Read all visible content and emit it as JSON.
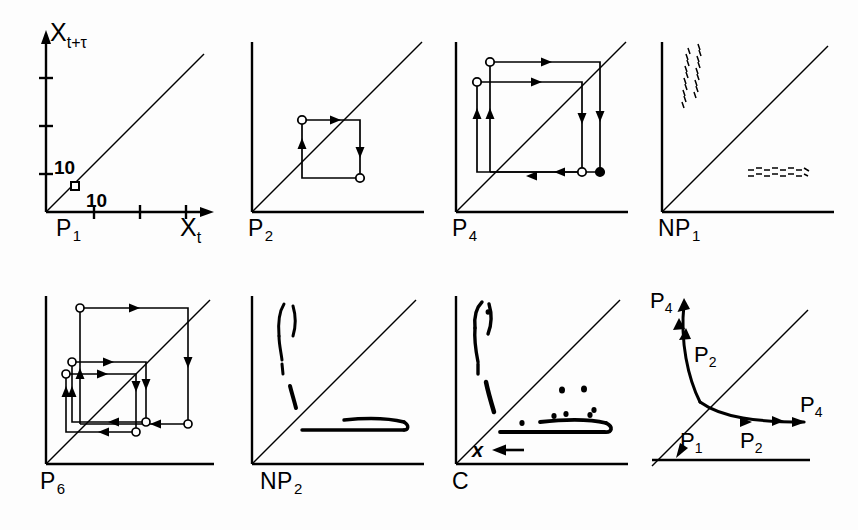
{
  "figure": {
    "background": "#fdfdfd",
    "ink": "#000000",
    "rows": 2,
    "cols": 4,
    "axis_labels": {
      "y": "X",
      "y_sub": "t+τ",
      "x": "X",
      "x_sub": "t",
      "y_tick_label": "10",
      "x_tick_label": "10"
    }
  },
  "panels": [
    {
      "id": "p1",
      "label": "P",
      "label_sub": "1",
      "caption": "P1",
      "type": "return-map",
      "description": "Fixed point: single open square marker on the identity diagonal",
      "markers": [
        {
          "kind": "open-square",
          "x": 0.16,
          "y": 0.16
        }
      ],
      "has_axes_labels": true,
      "diagonal": true
    },
    {
      "id": "p2",
      "label": "P",
      "label_sub": "2",
      "caption": "P2",
      "type": "return-map",
      "description": "Period-2 orbit: one square cycle with two open circles",
      "markers": [
        {
          "kind": "open-circle",
          "x": 0.33,
          "y": 0.62
        },
        {
          "kind": "open-circle",
          "x": 0.62,
          "y": 0.33
        }
      ],
      "diagonal": true
    },
    {
      "id": "p4",
      "label": "P",
      "label_sub": "4",
      "caption": "P4",
      "type": "return-map",
      "description": "Period-4 orbit: two nested rectangular cycles, three open circles and one filled circle",
      "markers": [
        {
          "kind": "open-circle",
          "x": 0.22,
          "y": 0.86
        },
        {
          "kind": "open-circle",
          "x": 0.16,
          "y": 0.74
        },
        {
          "kind": "open-circle",
          "x": 0.72,
          "y": 0.22
        },
        {
          "kind": "filled-circle",
          "x": 0.82,
          "y": 0.22
        }
      ],
      "diagonal": true
    },
    {
      "id": "np1",
      "label": "NP",
      "label_sub": "1",
      "caption": "NP1",
      "type": "noisy-return-map",
      "description": "Noisy period-1: one narrow vertical point cluster upper-left, one thin horizontal band lower-right",
      "clusters": [
        {
          "orientation": "vertical",
          "cx": 0.22,
          "cy": 0.78,
          "w": 0.06,
          "h": 0.3
        },
        {
          "orientation": "horizontal",
          "cx": 0.72,
          "cy": 0.28,
          "w": 0.34,
          "h": 0.05
        }
      ],
      "diagonal": true
    },
    {
      "id": "p6",
      "label": "P",
      "label_sub": "6",
      "caption": "P6",
      "type": "return-map",
      "description": "Period-6 orbit: three nested rectangular cycles with six circle markers",
      "markers": [
        {
          "kind": "open-circle",
          "x": 0.21,
          "y": 0.87
        },
        {
          "kind": "open-circle",
          "x": 0.17,
          "y": 0.58
        },
        {
          "kind": "open-circle",
          "x": 0.15,
          "y": 0.52
        },
        {
          "kind": "open-circle",
          "x": 0.56,
          "y": 0.21
        },
        {
          "kind": "open-circle",
          "x": 0.46,
          "y": 0.15
        },
        {
          "kind": "open-circle",
          "x": 0.86,
          "y": 0.21
        }
      ],
      "diagonal": true
    },
    {
      "id": "np2",
      "label": "NP",
      "label_sub": "2",
      "caption": "NP2",
      "type": "noisy-return-map",
      "description": "Noisy period-2: hooked vertical cluster upper-left plus a short steep segment, and a long horizontal band lower-right",
      "clusters": [
        {
          "orientation": "vertical-hook",
          "cx": 0.22,
          "cy": 0.8,
          "w": 0.07,
          "h": 0.34
        },
        {
          "orientation": "steep-segment",
          "cx": 0.26,
          "cy": 0.45,
          "w": 0.04,
          "h": 0.14
        },
        {
          "orientation": "horizontal",
          "cx": 0.66,
          "cy": 0.27,
          "w": 0.52,
          "h": 0.05
        }
      ],
      "diagonal": true
    },
    {
      "id": "c",
      "label": "C",
      "label_sub": "",
      "caption": "C",
      "type": "chaotic-return-map",
      "description": "Chaotic attractor: thick vertical blob upper-left, steep segment, broad horizontal band lower-right with scattered outlier points",
      "clusters": [
        {
          "orientation": "vertical-hook",
          "cx": 0.2,
          "cy": 0.8,
          "w": 0.08,
          "h": 0.36
        },
        {
          "orientation": "steep-segment",
          "cx": 0.24,
          "cy": 0.44,
          "w": 0.04,
          "h": 0.16
        },
        {
          "orientation": "horizontal",
          "cx": 0.64,
          "cy": 0.26,
          "w": 0.56,
          "h": 0.06
        }
      ],
      "annotation": {
        "marker": "x",
        "arrow": "left-arrow",
        "x": 0.3,
        "y": 0.09
      },
      "diagonal": true
    },
    {
      "id": "bifurcation",
      "label": "",
      "label_sub": "",
      "caption": "",
      "type": "bifurcation-schematic",
      "description": "Bifurcation schematic: incoming P1 branch on the diagonal splits at a node into an upper P2 branch ending in P4 and a lower-right P2 branch ending in P4",
      "branch_labels": [
        {
          "text": "P",
          "sub": "4",
          "x": 0.07,
          "y": 0.9
        },
        {
          "text": "P",
          "sub": "2",
          "x": 0.3,
          "y": 0.7
        },
        {
          "text": "P",
          "sub": "4",
          "x": 0.84,
          "y": 0.47
        },
        {
          "text": "P",
          "sub": "1",
          "x": 0.2,
          "y": 0.23
        },
        {
          "text": "P",
          "sub": "2",
          "x": 0.48,
          "y": 0.22
        }
      ],
      "diagonal": true
    }
  ]
}
